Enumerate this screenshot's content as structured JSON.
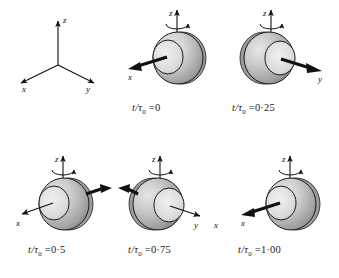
{
  "figure": {
    "type": "physics-diagram",
    "background_color": "#ffffff",
    "ink_color": "#111111",
    "sphere_light_gray": "#e2e2e2",
    "sphere_mid_gray": "#c2c2c2",
    "sphere_dark_gray": "#8f8f8f",
    "outline_color": "#1a1a1a"
  },
  "triad": {
    "name": "reference-axes",
    "axes": [
      {
        "id": "z",
        "label": "z",
        "direction": "up"
      },
      {
        "id": "x",
        "label": "x",
        "direction": "down-left"
      },
      {
        "id": "y",
        "label": "y",
        "direction": "down-right"
      }
    ]
  },
  "panels": [
    {
      "id": "t0",
      "caption_t": "t",
      "caption_slash": "/",
      "caption_tau": "τ",
      "caption_sub": "0",
      "caption_eq": "=",
      "caption_value": "0",
      "caption_full": "t/τ0 = 0",
      "spot_position": "left-front",
      "arrows": [
        {
          "id": "x-axis-arrow",
          "label": "x",
          "direction": "down-left",
          "weight": "thick"
        }
      ],
      "spin_arrow": "counterclockwise-about-z",
      "z_label": "z"
    },
    {
      "id": "t025",
      "caption_t": "t",
      "caption_slash": "/",
      "caption_tau": "τ",
      "caption_sub": "0",
      "caption_eq": "=",
      "caption_value": "0·25",
      "caption_full": "t/τ0 = 0·25",
      "spot_position": "right-front",
      "arrows": [
        {
          "id": "y-axis-arrow",
          "label": "y",
          "direction": "down-right",
          "weight": "thick"
        }
      ],
      "spin_arrow": "counterclockwise-about-z",
      "z_label": "z"
    },
    {
      "id": "t05",
      "caption_t": "t",
      "caption_slash": "/",
      "caption_tau": "τ",
      "caption_sub": "0",
      "caption_eq": "=",
      "caption_value": "0·5",
      "caption_full": "t/τ0 = 0·5",
      "spot_position": "left-front",
      "arrows": [
        {
          "id": "x-axis-arrow",
          "label": "x",
          "direction": "down-left",
          "weight": "thin"
        },
        {
          "id": "back-arrow",
          "label": "",
          "direction": "up-right",
          "weight": "thick"
        }
      ],
      "spin_arrow": "counterclockwise-about-z",
      "z_label": "z"
    },
    {
      "id": "t075",
      "caption_t": "t",
      "caption_slash": "/",
      "caption_tau": "τ",
      "caption_sub": "0",
      "caption_eq": "=",
      "caption_value": "0·75",
      "caption_full": "t/τ0 = 0·75",
      "spot_position": "right-front",
      "arrows": [
        {
          "id": "y-axis-arrow",
          "label": "y",
          "direction": "down-right",
          "weight": "thin"
        },
        {
          "id": "back-arrow",
          "label": "",
          "direction": "up-left",
          "weight": "thick"
        }
      ],
      "spin_arrow": "counterclockwise-about-z",
      "z_label": "z"
    },
    {
      "id": "t100",
      "caption_t": "t",
      "caption_slash": "/",
      "caption_tau": "τ",
      "caption_sub": "0",
      "caption_eq": "=",
      "caption_value": "1·00",
      "caption_full": "t/τ0 = 1·00",
      "spot_position": "left-front",
      "arrows": [
        {
          "id": "x-axis-arrow",
          "label": "x",
          "direction": "down-left",
          "weight": "thick"
        }
      ],
      "spin_arrow": "counterclockwise-about-z",
      "z_label": "z"
    }
  ],
  "shared_labels": {
    "x": "x",
    "y": "y",
    "z": "z",
    "extra_x_right": "x"
  }
}
